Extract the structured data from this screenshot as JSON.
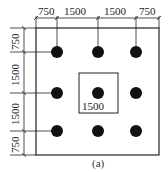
{
  "figure": {
    "caption": "(a)",
    "top_dimensions": [
      "750",
      "1500",
      "1500",
      "750"
    ],
    "left_dimensions": [
      "750",
      "1500",
      "1500",
      "750"
    ],
    "inner_square_label": "1500",
    "grid": {
      "rows": 3,
      "cols": 3,
      "spacing_mm": 1500,
      "edge_offset_mm": 750
    },
    "colors": {
      "line": "#222222",
      "dot": "#111111",
      "background": "#ffffff"
    }
  }
}
